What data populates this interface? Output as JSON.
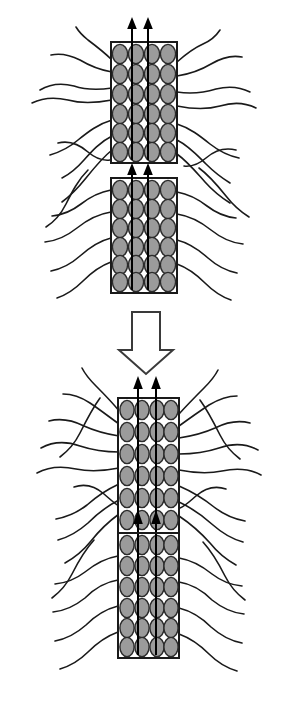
{
  "figure": {
    "title": "",
    "width": 300,
    "height": 707,
    "background_color": "#ffffff",
    "panels": [
      {
        "id": "before",
        "label": "",
        "description": "Two separate stacked blocks with gray ellipsoidal cells and upward flux arrows surrounded by radiating fibers"
      },
      {
        "id": "after",
        "label": "",
        "description": "Two fused adjoining blocks forming a continuous column with gray ellipsoidal cells and upward flux arrows surrounded by radiating fibers"
      }
    ]
  },
  "colors": {
    "cell_fill": "#9b9b9b",
    "cell_stroke": "#2b2b2b",
    "block_stroke": "#1a1a1a",
    "block_fill": "#ffffff",
    "fiber_stroke": "#1a1a1a",
    "arrow_color": "#000000",
    "transition_arrow_fill": "#ffffff",
    "transition_arrow_stroke": "#3a3a3a"
  },
  "blocks": [
    {
      "name": "top-upper-block",
      "panel": "before",
      "x": 111,
      "y": 42,
      "width": 66,
      "height": 121,
      "columns": 4,
      "rows": 6,
      "cell_count": 24,
      "arrow_columns": [
        2,
        3
      ]
    },
    {
      "name": "top-lower-block",
      "panel": "before",
      "x": 111,
      "y": 178,
      "width": 66,
      "height": 115,
      "columns": 4,
      "rows": 6,
      "cell_count": 24,
      "arrow_columns": [
        2,
        3
      ]
    },
    {
      "name": "bottom-upper-block",
      "panel": "after",
      "x": 118,
      "y": 398,
      "width": 61,
      "height": 135,
      "columns": 4,
      "rows": 6,
      "cell_count": 24,
      "arrow_columns": [
        2,
        3
      ]
    },
    {
      "name": "bottom-lower-block",
      "panel": "after",
      "x": 118,
      "y": 533,
      "width": 61,
      "height": 125,
      "columns": 4,
      "rows": 6,
      "cell_count": 24,
      "arrow_columns": [
        2,
        3
      ]
    }
  ],
  "transition_arrow": {
    "name": "downward-transition-arrow",
    "direction": "down",
    "style": "hollow-outline",
    "x": 128,
    "y": 312,
    "width": 36,
    "height": 62
  },
  "flux_arrows": [
    {
      "name": "top-upper-flux-left",
      "direction": "up",
      "x": 129,
      "y_top": 20,
      "y_bottom": 160
    },
    {
      "name": "top-upper-flux-right",
      "direction": "up",
      "x": 147,
      "y_top": 20,
      "y_bottom": 160
    },
    {
      "name": "top-lower-flux-left",
      "direction": "up",
      "x": 129,
      "y_top": 163,
      "y_bottom": 290
    },
    {
      "name": "top-lower-flux-right",
      "direction": "up",
      "x": 147,
      "y_top": 163,
      "y_bottom": 290
    },
    {
      "name": "bottom-upper-flux-left",
      "direction": "up",
      "x": 136,
      "y_top": 376,
      "y_bottom": 530
    },
    {
      "name": "bottom-upper-flux-right",
      "direction": "up",
      "x": 155,
      "y_top": 376,
      "y_bottom": 530
    },
    {
      "name": "bottom-lower-flux-left",
      "direction": "up",
      "x": 136,
      "y_top": 512,
      "y_bottom": 655
    },
    {
      "name": "bottom-lower-flux-right",
      "direction": "up",
      "x": 155,
      "y_top": 512,
      "y_bottom": 655
    }
  ],
  "fiber_count": {
    "before_panel": 16,
    "after_panel": 20
  }
}
